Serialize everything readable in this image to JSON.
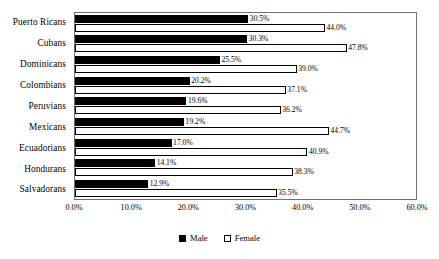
{
  "chart_data": {
    "type": "bar",
    "orientation": "horizontal",
    "title": "",
    "xlabel": "",
    "ylabel": "",
    "xlim": [
      0,
      60
    ],
    "xticks": [
      "0.0%",
      "10.0%",
      "20.0%",
      "30.0%",
      "40.0%",
      "50.0%",
      "60.0%"
    ],
    "xtick_values": [
      0,
      10,
      20,
      30,
      40,
      50,
      60
    ],
    "grid": false,
    "legend_position": "bottom-center",
    "value_label_suffix": "%",
    "categories": [
      "Puerto Ricans",
      "Cubans",
      "Dominicans",
      "Colombians",
      "Peruvians",
      "Mexicans",
      "Ecuadorians",
      "Hondurans",
      "Salvadorans"
    ],
    "series": [
      {
        "name": "Male",
        "color": "#000000",
        "values": [
          30.5,
          30.3,
          25.5,
          20.2,
          19.6,
          19.2,
          17.0,
          14.1,
          12.9
        ],
        "labels": [
          "30.5%",
          "30.3%",
          "25.5%",
          "20.2%",
          "19.6%",
          "19.2%",
          "17.0%",
          "14.1%",
          "12.9%"
        ]
      },
      {
        "name": "Female",
        "color": "#ffffff",
        "values": [
          44.0,
          47.8,
          39.0,
          37.1,
          36.2,
          44.7,
          40.9,
          38.3,
          35.5
        ],
        "labels": [
          "44.0%",
          "47.8%",
          "39.0%",
          "37.1%",
          "36.2%",
          "44.7%",
          "40.9%",
          "38.3%",
          "35.5%"
        ]
      }
    ]
  },
  "legend": {
    "items": [
      {
        "label": "Male",
        "swatch": "filled-square-black"
      },
      {
        "label": "Female",
        "swatch": "outline-square-white"
      }
    ]
  }
}
